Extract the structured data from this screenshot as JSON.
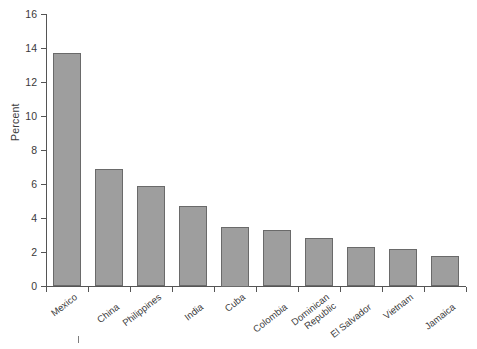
{
  "chart_data": {
    "type": "bar",
    "title": "",
    "xlabel": "",
    "ylabel": "Percent",
    "ylim": [
      0,
      16
    ],
    "yticks": [
      0,
      2,
      4,
      6,
      8,
      10,
      12,
      14,
      16
    ],
    "grid": false,
    "legend": null,
    "categories": [
      "Mexico",
      "China",
      "Philippines",
      "India",
      "Cuba",
      "Colombia",
      "Dominican Republic",
      "El Salvador",
      "Vietnam",
      "Jamaica"
    ],
    "values": [
      13.7,
      6.9,
      5.9,
      4.7,
      3.5,
      3.3,
      2.8,
      2.3,
      2.2,
      1.75
    ],
    "bar_color": "#9e9e9e",
    "bar_border_color": "#6a6a6a",
    "axis_color": "#555555"
  },
  "axis": {
    "y_title": "Percent",
    "y_tick_labels": [
      "16",
      "14",
      "12",
      "10",
      "8",
      "6",
      "4",
      "2",
      "0"
    ]
  },
  "categories": [
    {
      "label": "Mexico",
      "lines": [
        "Mexico"
      ]
    },
    {
      "label": "China",
      "lines": [
        "China"
      ]
    },
    {
      "label": "Philippines",
      "lines": [
        "Philippines"
      ]
    },
    {
      "label": "India",
      "lines": [
        "India"
      ]
    },
    {
      "label": "Cuba",
      "lines": [
        "Cuba"
      ]
    },
    {
      "label": "Colombia",
      "lines": [
        "Colombia"
      ]
    },
    {
      "label": "Dominican Republic",
      "lines": [
        "Dominican",
        "Republic"
      ]
    },
    {
      "label": "El Salvador",
      "lines": [
        "El Salvador"
      ]
    },
    {
      "label": "Vietnam",
      "lines": [
        "Vietnam"
      ]
    },
    {
      "label": "Jamaica",
      "lines": [
        "Jamaica"
      ]
    }
  ]
}
